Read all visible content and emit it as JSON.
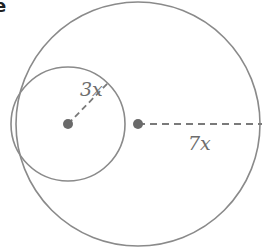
{
  "figure": {
    "cropped_text": "e",
    "colors": {
      "stroke": "#8a8a8a",
      "dot": "#6a6a6a",
      "label": "#6d6d6d"
    },
    "outer_circle": {
      "cx": 138,
      "cy": 124,
      "r": 122,
      "radius_label": "7x"
    },
    "inner_circle": {
      "cx": 68,
      "cy": 124,
      "r": 57,
      "radius_label": "3x"
    },
    "labels": {
      "inner_radius": "3x",
      "outer_radius": "7x"
    }
  }
}
